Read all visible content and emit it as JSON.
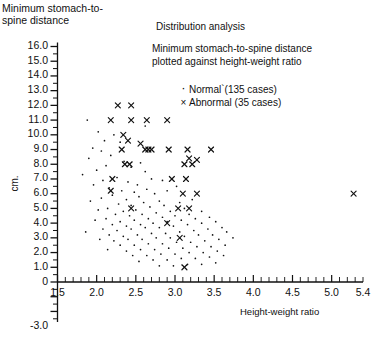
{
  "figure": {
    "y_axis_caption": "Minimum stomach-to-spine distance",
    "y_unit_label": "cm.",
    "title": "Distribution analysis",
    "subtitle_line1": "Minimum stomach-to-spine distance",
    "subtitle_line2": "plotted against height-weight ratio",
    "x_axis_title": "Height-weight ratio"
  },
  "legend": {
    "items": [
      {
        "symbol": "·",
        "symbol_name": "dot-marker",
        "label": "Normal`(135 cases)"
      },
      {
        "symbol": "×",
        "symbol_name": "cross-marker",
        "label": "Abnormal (35 cases)"
      }
    ]
  },
  "chart_data": {
    "type": "scatter",
    "title": "Distribution analysis",
    "subtitle": "Minimum stomach-to-spine distance plotted against height-weight ratio",
    "xlabel": "Height-weight ratio",
    "ylabel": "cm.",
    "grid": false,
    "legend_position": "upper-center",
    "xlim": [
      1.5,
      5.4
    ],
    "ylim": [
      -3.0,
      16.0
    ],
    "x_ticks": [
      1.5,
      2.0,
      2.5,
      3.0,
      3.5,
      4.0,
      4.5,
      5.0,
      5.4
    ],
    "x_tick_labels": [
      "1.5",
      "2.0",
      "2.5",
      "3.0",
      "3.5",
      "4.0",
      "4.5",
      "5.0",
      "5.4"
    ],
    "x_minor_step": 0.1,
    "y_ticks": [
      16.0,
      15.0,
      14.0,
      13.0,
      12.0,
      11.0,
      10.0,
      9.0,
      8.0,
      7.0,
      6.0,
      5.0,
      4.0,
      3.0,
      2.0,
      1.0,
      0,
      -3.0
    ],
    "y_tick_labels": [
      "16.0",
      "15.0",
      "14.0",
      "13.0",
      "12.0",
      "11.0",
      "10.0",
      "9.0",
      "8.0",
      "7.0",
      "6.0",
      "5.0",
      "4.0",
      "3.0",
      "2.0",
      "1.0",
      "0",
      "-3.0"
    ],
    "y_minor_step": 0.5,
    "series": [
      {
        "name": "Normal`(135 cases)",
        "marker": "dot",
        "count": 135,
        "points": [
          [
            1.88,
            11.0
          ],
          [
            2.02,
            10.2
          ],
          [
            2.1,
            9.6
          ],
          [
            1.95,
            9.1
          ],
          [
            2.06,
            8.9
          ],
          [
            1.9,
            8.4
          ],
          [
            2.22,
            10.0
          ],
          [
            2.3,
            9.5
          ],
          [
            2.18,
            8.6
          ],
          [
            2.35,
            8.2
          ],
          [
            2.12,
            7.9
          ],
          [
            2.0,
            7.6
          ],
          [
            1.82,
            7.3
          ],
          [
            2.44,
            7.8
          ],
          [
            2.56,
            8.1
          ],
          [
            2.62,
            7.5
          ],
          [
            2.26,
            7.1
          ],
          [
            2.08,
            6.9
          ],
          [
            1.96,
            6.6
          ],
          [
            2.16,
            6.4
          ],
          [
            2.4,
            6.8
          ],
          [
            2.52,
            6.6
          ],
          [
            2.7,
            7.0
          ],
          [
            2.84,
            6.9
          ],
          [
            2.32,
            6.2
          ],
          [
            2.48,
            6.1
          ],
          [
            2.64,
            6.3
          ],
          [
            2.2,
            5.9
          ],
          [
            2.06,
            5.7
          ],
          [
            1.92,
            5.5
          ],
          [
            2.38,
            5.6
          ],
          [
            2.54,
            5.8
          ],
          [
            2.74,
            6.0
          ],
          [
            2.9,
            6.2
          ],
          [
            3.02,
            6.5
          ],
          [
            2.28,
            5.3
          ],
          [
            2.44,
            5.2
          ],
          [
            2.6,
            5.4
          ],
          [
            2.8,
            5.5
          ],
          [
            2.14,
            5.0
          ],
          [
            2.02,
            4.9
          ],
          [
            2.34,
            4.8
          ],
          [
            2.5,
            4.9
          ],
          [
            2.68,
            5.1
          ],
          [
            2.86,
            5.2
          ],
          [
            3.06,
            5.4
          ],
          [
            3.22,
            5.6
          ],
          [
            2.24,
            4.6
          ],
          [
            2.42,
            4.5
          ],
          [
            2.58,
            4.6
          ],
          [
            2.76,
            4.7
          ],
          [
            2.94,
            4.8
          ],
          [
            3.12,
            5.0
          ],
          [
            2.12,
            4.3
          ],
          [
            1.98,
            4.2
          ],
          [
            2.3,
            4.1
          ],
          [
            2.48,
            4.2
          ],
          [
            2.66,
            4.3
          ],
          [
            2.84,
            4.4
          ],
          [
            3.0,
            4.5
          ],
          [
            3.18,
            4.6
          ],
          [
            3.34,
            4.8
          ],
          [
            2.2,
            3.9
          ],
          [
            2.38,
            3.8
          ],
          [
            2.56,
            3.9
          ],
          [
            2.72,
            4.0
          ],
          [
            2.9,
            4.1
          ],
          [
            3.08,
            4.2
          ],
          [
            3.26,
            4.3
          ],
          [
            3.44,
            4.4
          ],
          [
            2.08,
            3.6
          ],
          [
            2.26,
            3.5
          ],
          [
            2.44,
            3.6
          ],
          [
            2.62,
            3.7
          ],
          [
            2.8,
            3.7
          ],
          [
            2.98,
            3.8
          ],
          [
            3.16,
            3.9
          ],
          [
            3.34,
            4.0
          ],
          [
            3.52,
            4.1
          ],
          [
            2.16,
            3.2
          ],
          [
            2.34,
            3.1
          ],
          [
            2.52,
            3.2
          ],
          [
            2.7,
            3.3
          ],
          [
            2.88,
            3.3
          ],
          [
            3.06,
            3.4
          ],
          [
            3.24,
            3.5
          ],
          [
            3.42,
            3.6
          ],
          [
            3.6,
            3.7
          ],
          [
            2.04,
            2.9
          ],
          [
            2.22,
            2.8
          ],
          [
            2.4,
            2.9
          ],
          [
            2.58,
            2.9
          ],
          [
            2.76,
            3.0
          ],
          [
            2.94,
            3.0
          ],
          [
            3.12,
            3.1
          ],
          [
            3.3,
            3.2
          ],
          [
            3.48,
            3.2
          ],
          [
            3.66,
            3.4
          ],
          [
            2.3,
            2.5
          ],
          [
            2.48,
            2.5
          ],
          [
            2.66,
            2.6
          ],
          [
            2.84,
            2.6
          ],
          [
            3.02,
            2.7
          ],
          [
            3.2,
            2.7
          ],
          [
            3.38,
            2.8
          ],
          [
            3.56,
            2.9
          ],
          [
            3.74,
            3.0
          ],
          [
            2.14,
            2.2
          ],
          [
            2.38,
            2.1
          ],
          [
            2.56,
            2.2
          ],
          [
            2.74,
            2.2
          ],
          [
            2.92,
            2.3
          ],
          [
            3.1,
            2.3
          ],
          [
            3.28,
            2.4
          ],
          [
            3.46,
            2.4
          ],
          [
            3.64,
            2.5
          ],
          [
            2.46,
            1.8
          ],
          [
            2.64,
            1.8
          ],
          [
            2.82,
            1.9
          ],
          [
            3.0,
            1.9
          ],
          [
            3.18,
            2.0
          ],
          [
            3.36,
            2.0
          ],
          [
            3.54,
            2.1
          ],
          [
            2.54,
            1.4
          ],
          [
            2.72,
            1.5
          ],
          [
            2.9,
            1.5
          ],
          [
            3.08,
            1.6
          ],
          [
            3.26,
            1.6
          ],
          [
            3.44,
            1.7
          ],
          [
            3.62,
            1.8
          ],
          [
            2.8,
            1.1
          ],
          [
            2.98,
            1.1
          ],
          [
            3.16,
            1.2
          ],
          [
            3.34,
            1.2
          ],
          [
            3.52,
            1.3
          ],
          [
            1.86,
            3.4
          ],
          [
            2.62,
            10.6
          ]
        ]
      },
      {
        "name": "Abnormal (35 cases)",
        "marker": "cross",
        "count": 35,
        "points": [
          [
            2.27,
            12.0
          ],
          [
            2.44,
            12.0
          ],
          [
            2.18,
            11.0
          ],
          [
            2.44,
            11.0
          ],
          [
            2.64,
            11.0
          ],
          [
            2.9,
            11.0
          ],
          [
            2.34,
            10.0
          ],
          [
            2.4,
            9.6
          ],
          [
            2.56,
            9.4
          ],
          [
            2.32,
            9.0
          ],
          [
            2.62,
            9.0
          ],
          [
            2.66,
            9.0
          ],
          [
            2.7,
            9.0
          ],
          [
            2.92,
            9.0
          ],
          [
            3.16,
            9.0
          ],
          [
            3.46,
            9.0
          ],
          [
            3.18,
            8.4
          ],
          [
            3.28,
            8.3
          ],
          [
            2.36,
            8.0
          ],
          [
            2.42,
            8.0
          ],
          [
            3.12,
            8.0
          ],
          [
            3.22,
            8.0
          ],
          [
            2.2,
            7.0
          ],
          [
            2.96,
            7.0
          ],
          [
            3.14,
            7.0
          ],
          [
            2.18,
            6.2
          ],
          [
            3.1,
            6.0
          ],
          [
            3.28,
            6.0
          ],
          [
            5.28,
            6.0
          ],
          [
            2.44,
            5.0
          ],
          [
            3.04,
            5.0
          ],
          [
            3.18,
            5.0
          ],
          [
            2.9,
            4.0
          ],
          [
            3.06,
            3.0
          ],
          [
            3.12,
            1.0
          ]
        ]
      }
    ]
  }
}
